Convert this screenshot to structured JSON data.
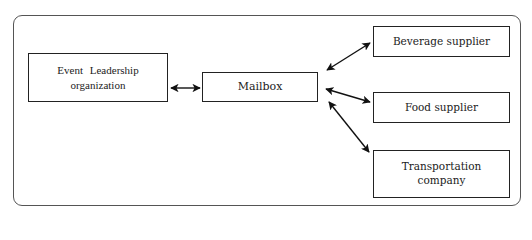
{
  "diagram": {
    "type": "communication-flow",
    "nodes": [
      {
        "id": "elo",
        "label_line1": "Event  Leadership",
        "label_line2": "organization"
      },
      {
        "id": "mailbox",
        "label": "Mailbox"
      },
      {
        "id": "beverage",
        "label": "Beverage supplier"
      },
      {
        "id": "food",
        "label": "Food supplier"
      },
      {
        "id": "transport",
        "label_line1": "Transportation",
        "label_line2": "company"
      }
    ],
    "edges": [
      {
        "from": "elo",
        "to": "mailbox",
        "direction": "both"
      },
      {
        "from": "mailbox",
        "to": "beverage",
        "direction": "both"
      },
      {
        "from": "mailbox",
        "to": "food",
        "direction": "both"
      },
      {
        "from": "mailbox",
        "to": "transport",
        "direction": "both"
      }
    ],
    "colors": {
      "stroke": "#222222",
      "frame": "#555555",
      "background": "#ffffff"
    }
  }
}
